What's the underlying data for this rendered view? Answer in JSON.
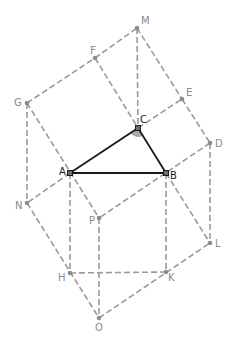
{
  "diagram": {
    "points": {
      "A": {
        "x": 70,
        "y": 173,
        "label": "A",
        "primary": true
      },
      "B": {
        "x": 166,
        "y": 173,
        "label": "B",
        "primary": true
      },
      "C": {
        "x": 138,
        "y": 128,
        "label": "C",
        "primary": true
      },
      "D": {
        "x": 210,
        "y": 143,
        "label": "D"
      },
      "E": {
        "x": 182,
        "y": 99,
        "label": "E"
      },
      "F": {
        "x": 95,
        "y": 58,
        "label": "F"
      },
      "G": {
        "x": 27,
        "y": 103,
        "label": "G"
      },
      "M": {
        "x": 137,
        "y": 28,
        "label": "M"
      },
      "N": {
        "x": 27,
        "y": 203,
        "label": "N"
      },
      "P": {
        "x": 99,
        "y": 218,
        "label": "P"
      },
      "H": {
        "x": 70,
        "y": 273,
        "label": "H"
      },
      "K": {
        "x": 166,
        "y": 272,
        "label": "K"
      },
      "L": {
        "x": 210,
        "y": 243,
        "label": "L"
      },
      "O": {
        "x": 99,
        "y": 318,
        "label": "O"
      }
    },
    "solid_segments": [
      [
        "A",
        "B"
      ],
      [
        "B",
        "C"
      ],
      [
        "C",
        "A"
      ]
    ],
    "dashed_segments": [
      [
        "G",
        "F"
      ],
      [
        "F",
        "M"
      ],
      [
        "M",
        "E"
      ],
      [
        "E",
        "D"
      ],
      [
        "F",
        "C"
      ],
      [
        "M",
        "C"
      ],
      [
        "C",
        "E"
      ],
      [
        "G",
        "N"
      ],
      [
        "G",
        "P"
      ],
      [
        "A",
        "N"
      ],
      [
        "A",
        "H"
      ],
      [
        "D",
        "P"
      ],
      [
        "B",
        "K"
      ],
      [
        "B",
        "L"
      ],
      [
        "D",
        "L"
      ],
      [
        "P",
        "O"
      ],
      [
        "N",
        "O"
      ],
      [
        "H",
        "K"
      ],
      [
        "O",
        "L"
      ]
    ],
    "angle_mark": {
      "vertex": "C",
      "color": "#a8a8a8"
    },
    "colors": {
      "solid": "#1a1a1a",
      "dashed": "#9a9a9a",
      "label": "#8a8a8a",
      "label_primary": "#1a1a1a"
    }
  }
}
